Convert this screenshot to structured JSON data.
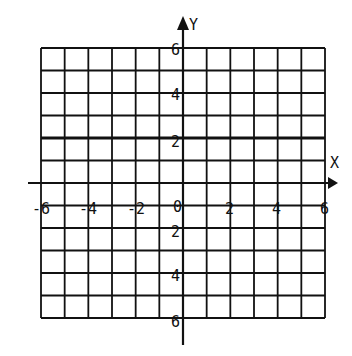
{
  "chart_data": {
    "type": "grid",
    "title": "",
    "xlabel": "X",
    "ylabel": "Y",
    "xlim": [
      -6,
      6
    ],
    "ylim": [
      -6,
      6
    ],
    "grid": true,
    "grid_step": 1,
    "x_tick_labels": [
      "-6",
      "-4",
      "-2",
      "2",
      "4",
      "6"
    ],
    "y_tick_labels_positive": [
      "6",
      "4",
      "2"
    ],
    "y_tick_labels_negative": [
      "2",
      "4",
      "6"
    ],
    "origin_label": "0",
    "highlighted_line": {
      "equation": "y = 2",
      "orientation": "horizontal"
    }
  },
  "axes": {
    "x_label": "X",
    "y_label": "Y",
    "origin": "0"
  },
  "colors": {
    "line": "#111111",
    "background": "#ffffff"
  }
}
